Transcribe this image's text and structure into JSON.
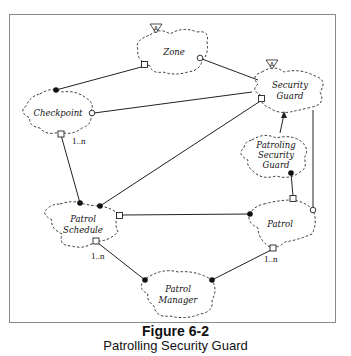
{
  "figure": {
    "number": "Figure 6-2",
    "title": "Patrolling Security Guard"
  },
  "diagram": {
    "entities": [
      {
        "id": "zone",
        "label_lines": [
          "Zone"
        ],
        "abstract": true
      },
      {
        "id": "security-guard",
        "label_lines": [
          "Security",
          "Guard"
        ],
        "abstract": true
      },
      {
        "id": "checkpoint",
        "label_lines": [
          "Checkpoint"
        ],
        "abstract": false
      },
      {
        "id": "patroling-security-guard",
        "label_lines": [
          "Patroling",
          "Security",
          "Guard"
        ],
        "abstract": false
      },
      {
        "id": "patrol-schedule",
        "label_lines": [
          "Patrol",
          "Schedule"
        ],
        "abstract": false
      },
      {
        "id": "patrol",
        "label_lines": [
          "Patrol"
        ],
        "abstract": false
      },
      {
        "id": "patrol-manager",
        "label_lines": [
          "Patrol",
          "Manager"
        ],
        "abstract": false
      }
    ],
    "abstract_marker": "A",
    "relationships": [
      {
        "from": "zone",
        "from_end": "square",
        "to": "checkpoint",
        "to_end": "filled-dot"
      },
      {
        "from": "zone",
        "from_end": "circle",
        "to": "security-guard",
        "to_end": "none"
      },
      {
        "from": "checkpoint",
        "from_end": "circle",
        "to": "security-guard",
        "to_end": "none"
      },
      {
        "from": "checkpoint",
        "from_end": "square",
        "from_multiplicity": "1..n",
        "to": "patrol-schedule",
        "to_end": "filled-dot"
      },
      {
        "from": "security-guard",
        "from_end": "square",
        "to": "patrol-schedule",
        "to_end": "filled-dot"
      },
      {
        "from": "security-guard",
        "from_end": "none",
        "to": "patrol",
        "to_end": "circle"
      },
      {
        "from": "patroling-security-guard",
        "from_end": "none",
        "to": "security-guard",
        "to_end": "arrow",
        "type": "inheritance"
      },
      {
        "from": "patroling-security-guard",
        "from_end": "filled-dot",
        "to": "patrol",
        "to_end": "square"
      },
      {
        "from": "patrol-schedule",
        "from_end": "square",
        "to": "patrol",
        "to_end": "filled-dot"
      },
      {
        "from": "patrol-schedule",
        "from_end": "square",
        "from_multiplicity": "1..n",
        "to": "patrol-manager",
        "to_end": "filled-dot"
      },
      {
        "from": "patrol",
        "from_end": "square",
        "from_multiplicity": "1..n",
        "to": "patrol-manager",
        "to_end": "filled-dot"
      }
    ],
    "multiplicity_labels": {
      "checkpoint": "1..n",
      "patrol_schedule": "1..n",
      "patrol": "1..n"
    }
  }
}
